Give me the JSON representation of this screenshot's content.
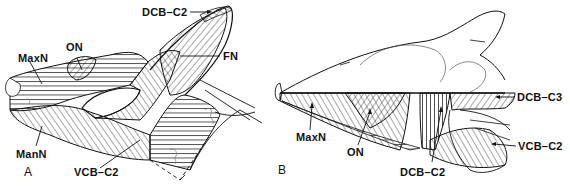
{
  "figure": {
    "panels": [
      {
        "letter": "A",
        "view": "lateral oblique, head raised",
        "labels": {
          "maxn": "MaxN",
          "on": "ON",
          "dcb_c2": "DCB–C2",
          "fn": "FN",
          "mann": "ManN",
          "vcb_c2": "VCB–C2"
        }
      },
      {
        "letter": "B",
        "view": "lateral, head lowered",
        "labels": {
          "dcb_c3": "DCB–C3",
          "maxn": "MaxN",
          "on": "ON",
          "vcb_c2": "VCB–C2",
          "dcb_c2": "DCB–C2"
        }
      }
    ],
    "colors": {
      "ink": "#111111",
      "background": "#ffffff"
    }
  }
}
